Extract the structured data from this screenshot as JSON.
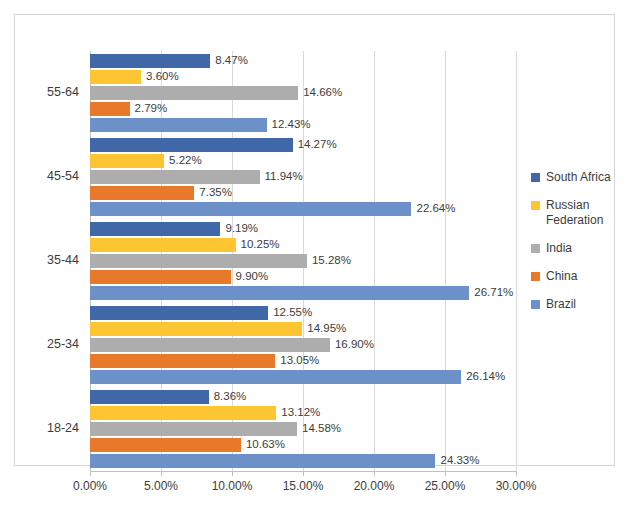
{
  "chart_data": {
    "type": "bar",
    "orientation": "horizontal",
    "title": "",
    "xlabel": "",
    "ylabel": "",
    "xlim": [
      0,
      30
    ],
    "xtick_labels": [
      "0.00%",
      "5.00%",
      "10.00%",
      "15.00%",
      "20.00%",
      "25.00%",
      "30.00%"
    ],
    "xticks": [
      0,
      5,
      10,
      15,
      20,
      25,
      30
    ],
    "grid": true,
    "legend_position": "right",
    "categories": [
      "55-64",
      "45-54",
      "35-44",
      "25-34",
      "18-24"
    ],
    "series": [
      {
        "name": "South Africa",
        "color": "#4068A8",
        "values": [
          8.47,
          14.27,
          9.19,
          12.55,
          8.36
        ],
        "labels": [
          "8.47%",
          "14.27%",
          "9.19%",
          "12.55%",
          "8.36%"
        ]
      },
      {
        "name": "Russian Federation",
        "color": "#FCC531",
        "values": [
          3.6,
          5.22,
          10.25,
          14.95,
          13.12
        ],
        "labels": [
          "3.60%",
          "5.22%",
          "10.25%",
          "14.95%",
          "13.12%"
        ]
      },
      {
        "name": "India",
        "color": "#ADADAD",
        "values": [
          14.66,
          11.94,
          15.28,
          16.9,
          14.58
        ],
        "labels": [
          "14.66%",
          "11.94%",
          "15.28%",
          "16.90%",
          "14.58%"
        ]
      },
      {
        "name": "China",
        "color": "#E8792A",
        "values": [
          2.79,
          7.35,
          9.9,
          13.05,
          10.63
        ],
        "labels": [
          "2.79%",
          "7.35%",
          "9.90%",
          "13.05%",
          "10.63%"
        ]
      },
      {
        "name": "Brazil",
        "color": "#6C91C8",
        "values": [
          12.43,
          22.64,
          26.71,
          26.14,
          24.33
        ],
        "labels": [
          "12.43%",
          "22.64%",
          "26.71%",
          "26.14%",
          "24.33%"
        ]
      }
    ]
  },
  "legend": {
    "items": [
      {
        "label": "South Africa",
        "color": "#4068A8"
      },
      {
        "label": "Russian Federation",
        "color": "#FCC531"
      },
      {
        "label": "India",
        "color": "#ADADAD"
      },
      {
        "label": "China",
        "color": "#E8792A"
      },
      {
        "label": "Brazil",
        "color": "#6C91C8"
      }
    ]
  }
}
